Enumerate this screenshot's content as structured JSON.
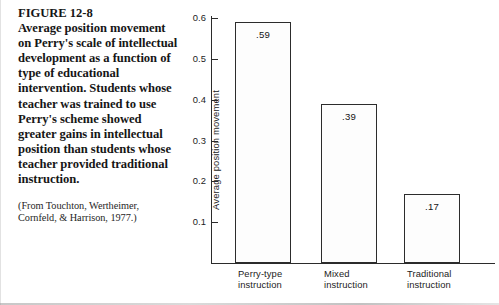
{
  "figure": {
    "title": "FIGURE 12-8",
    "caption": "Average position movement on Perry's scale of intellectual development as a function of type of educational intervention. Students whose teacher was trained to use Perry's scheme showed greater gains in intellectual position than students whose teacher provided traditional instruction.",
    "source": "(From Touchton, Wertheimer, Cornfeld, & Harrison, 1977.)"
  },
  "chart_data": {
    "type": "bar",
    "title": "",
    "xlabel": "",
    "ylabel": "Average position movement",
    "categories": [
      "Perry-type\ninstruction",
      "Mixed\ninstruction",
      "Traditional\ninstruction"
    ],
    "values": [
      0.59,
      0.39,
      0.17
    ],
    "value_labels": [
      ".59",
      ".39",
      ".17"
    ],
    "ylim": [
      0,
      0.6
    ],
    "yticks": [
      0.1,
      0.2,
      0.3,
      0.4,
      0.5,
      0.6
    ],
    "ytick_labels": [
      "0.1",
      "0.2",
      "0.3",
      "0.4",
      "0.5",
      "0.6"
    ],
    "grid": false,
    "legend": false,
    "bar_fill": "#fdfdfd",
    "bar_stroke": "#2c2c2c",
    "axis_color": "#2b2b2b"
  }
}
